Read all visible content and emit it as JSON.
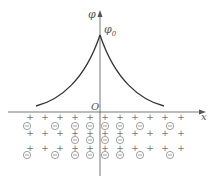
{
  "diagram": {
    "axes": {
      "y_label": "φ",
      "x_label": "x",
      "origin_label": "O",
      "peak_label": "φ",
      "peak_label_subscript": "0"
    },
    "curve": {
      "description": "Potential φ peaks at φ0 at x=0 and decays symmetrically on both sides",
      "shape": "cusp-exponential-decay"
    },
    "charges": {
      "positive_symbol": "+",
      "negative_symbol": "⊖",
      "rows": [
        {
          "type": "positive",
          "count": 11
        },
        {
          "type": "negative",
          "count": 8
        },
        {
          "type": "positive",
          "count": 11
        },
        {
          "type": "negative",
          "count": 4
        },
        {
          "type": "positive",
          "count": 11
        },
        {
          "type": "negative",
          "count": 8
        }
      ]
    }
  }
}
